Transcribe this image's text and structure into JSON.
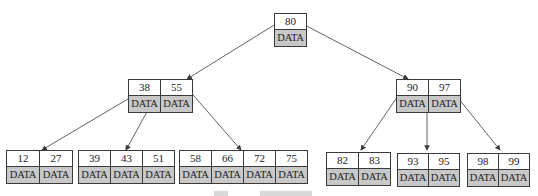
{
  "diagram": {
    "type": "B+ tree",
    "colors": {
      "line": "#3a3a3a",
      "data_fill": "#c8c8c8",
      "key_fill": "#ffffff"
    },
    "root": {
      "keys": [
        "80"
      ],
      "data": [
        "DATA"
      ]
    },
    "internal": [
      {
        "keys": [
          "38",
          "55"
        ],
        "data": [
          "DATA",
          "DATA"
        ]
      },
      {
        "keys": [
          "90",
          "97"
        ],
        "data": [
          "DATA",
          "DATA"
        ]
      }
    ],
    "leaves": [
      {
        "keys": [
          "12",
          "27"
        ],
        "data": [
          "DATA",
          "DATA"
        ]
      },
      {
        "keys": [
          "39",
          "43",
          "51"
        ],
        "data": [
          "DATA",
          "DATA",
          "DATA"
        ]
      },
      {
        "keys": [
          "58",
          "66",
          "72",
          "75"
        ],
        "data": [
          "DATA",
          "DATA",
          "DATA",
          "DATA"
        ]
      },
      {
        "keys": [
          "82",
          "83"
        ],
        "data": [
          "DATA",
          "DATA"
        ]
      },
      {
        "keys": [
          "93",
          "95"
        ],
        "data": [
          "DATA",
          "DATA"
        ]
      },
      {
        "keys": [
          "98",
          "99"
        ],
        "data": [
          "DATA",
          "DATA"
        ]
      }
    ]
  }
}
